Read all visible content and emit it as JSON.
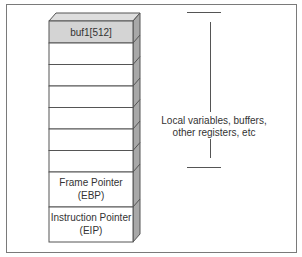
{
  "diagram": {
    "title_partial": "",
    "stack": {
      "top_cell": {
        "label": "buf1[512]",
        "fill": "#d4d4d4"
      },
      "empty_cells": 6,
      "frame_pointer": {
        "line1": "Frame Pointer",
        "line2": "(EBP)"
      },
      "instruction_pointer": {
        "line1": "Instruction Pointer",
        "line2": "(EIP)"
      }
    },
    "bracket_note": {
      "line1": "Local variables, buffers,",
      "line2": "other registers, etc"
    },
    "colors": {
      "border": "#555555",
      "side_face": "#a8a8a8",
      "top_face": "#dedede",
      "frame": "#7a7a7a"
    }
  }
}
